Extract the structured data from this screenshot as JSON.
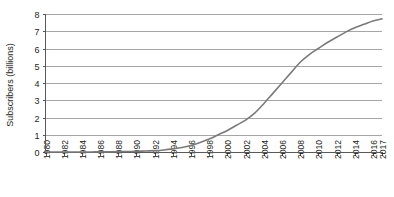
{
  "chart_data": {
    "type": "line",
    "title": "",
    "subtitle": "",
    "xlabel": "",
    "ylabel": "Subscribers (billions)",
    "xlim": [
      1980,
      2017
    ],
    "ylim": [
      0,
      8
    ],
    "grid": "horizontal",
    "legend": "none",
    "y_ticks": [
      0,
      1,
      2,
      3,
      4,
      5,
      6,
      7,
      8
    ],
    "y_tick_labels": [
      "0",
      "1",
      "2",
      "3",
      "4",
      "5",
      "6",
      "7",
      "8"
    ],
    "x_tick_labels": [
      "1980",
      "1982",
      "1984",
      "1986",
      "1988",
      "1990",
      "1992",
      "1994",
      "1996",
      "1998",
      "2000",
      "2002",
      "2004",
      "2006",
      "2008",
      "2010",
      "2012",
      "2014",
      "2016",
      "2017"
    ],
    "x_tick_values": [
      1980,
      1982,
      1984,
      1986,
      1988,
      1990,
      1992,
      1994,
      1996,
      1998,
      2000,
      2002,
      2004,
      2006,
      2008,
      2010,
      2012,
      2014,
      2016,
      2017
    ],
    "series": [
      {
        "name": "Mobile cellular subscriptions",
        "color": "#7a7a7a",
        "x": [
          1980,
          1981,
          1982,
          1983,
          1984,
          1985,
          1986,
          1987,
          1988,
          1989,
          1990,
          1991,
          1992,
          1993,
          1994,
          1995,
          1996,
          1997,
          1998,
          1999,
          2000,
          2001,
          2002,
          2003,
          2004,
          2005,
          2006,
          2007,
          2008,
          2009,
          2010,
          2011,
          2012,
          2013,
          2014,
          2015,
          2016,
          2017
        ],
        "values": [
          0.0,
          0.0,
          0.0,
          0.0,
          0.0,
          0.0,
          0.01,
          0.01,
          0.02,
          0.03,
          0.04,
          0.06,
          0.08,
          0.12,
          0.18,
          0.26,
          0.38,
          0.55,
          0.75,
          1.0,
          1.25,
          1.55,
          1.85,
          2.25,
          2.8,
          3.4,
          4.0,
          4.6,
          5.2,
          5.65,
          6.0,
          6.35,
          6.65,
          6.95,
          7.2,
          7.4,
          7.6,
          7.72
        ]
      }
    ]
  }
}
